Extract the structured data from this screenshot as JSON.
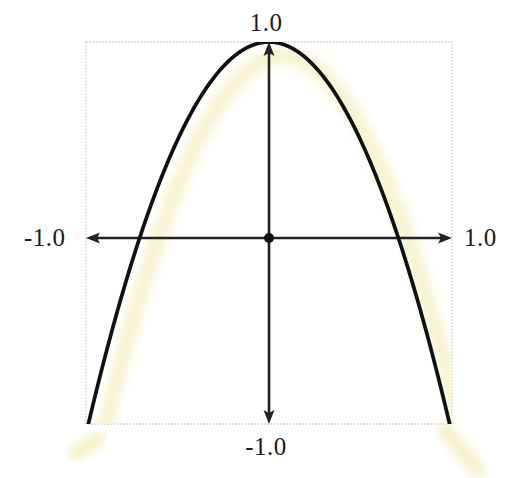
{
  "figure": {
    "name": "parabola-plot",
    "background_color": "#ffffff",
    "frame": {
      "color": "#cccccc",
      "style": "dotted",
      "x_min_px": 86,
      "y_min_px": 42,
      "x_max_px": 452,
      "y_max_px": 424
    },
    "origin_px": {
      "x": 269,
      "y": 238
    },
    "origin_marker": {
      "name": "origin-dot",
      "color": "#111111",
      "radius_px": 5
    }
  },
  "labels": {
    "top": "1.0",
    "bottom": "-1.0",
    "left": "-1.0",
    "right": "1.0"
  },
  "colors": {
    "curve": "#111111",
    "glow": "#f7f2cd",
    "axis": "#222222",
    "frame": "#cccccc",
    "text": "#1a1a1a",
    "background": "#ffffff"
  },
  "chart_data": {
    "type": "line",
    "title": "",
    "subtitle": "",
    "xlabel": "",
    "ylabel": "",
    "xlim": [
      -1.0,
      1.0
    ],
    "ylim": [
      -1.0,
      1.0
    ],
    "grid": false,
    "legend": null,
    "axes": {
      "x_axis": {
        "name": "horizontal-axis",
        "arrows": [
          "left",
          "right"
        ],
        "tick_labels": [
          "-1.0",
          "1.0"
        ],
        "tick_values": [
          -1.0,
          1.0
        ]
      },
      "y_axis": {
        "name": "vertical-axis",
        "arrows": [
          "up",
          "down"
        ],
        "tick_labels": [
          "1.0",
          "-1.0"
        ],
        "tick_values": [
          1.0,
          -1.0
        ]
      }
    },
    "annotations": [
      {
        "name": "origin-point",
        "x": 0.0,
        "y": 0.0,
        "label": ""
      },
      {
        "name": "vertex-point",
        "x": 0.0,
        "y": 1.0,
        "label": ""
      }
    ],
    "series": [
      {
        "name": "y = 1 - 2x^2",
        "expression": "1 - 2*x^2",
        "color": "#111111",
        "linewidth_px": 6,
        "x": [
          -1.0,
          -0.9,
          -0.8,
          -0.7071,
          -0.7,
          -0.6,
          -0.5,
          -0.4,
          -0.3,
          -0.2,
          -0.1,
          0.0,
          0.1,
          0.2,
          0.3,
          0.4,
          0.5,
          0.6,
          0.7,
          0.7071,
          0.8,
          0.9,
          1.0
        ],
        "values": [
          -1.0,
          -0.62,
          -0.28,
          0.0,
          0.02,
          0.28,
          0.5,
          0.68,
          0.82,
          0.92,
          0.98,
          1.0,
          0.98,
          0.92,
          0.82,
          0.68,
          0.5,
          0.28,
          0.02,
          0.0,
          -0.28,
          -0.62,
          -1.0
        ],
        "roots": [
          -0.7071,
          0.7071
        ],
        "vertex": {
          "x": 0.0,
          "y": 1.0
        }
      },
      {
        "name": "glow-shadow",
        "expression": "1 - 2*x^2 (offset)",
        "color": "#f7f2cd",
        "linewidth_px": 16,
        "offset_px": {
          "x": 14,
          "y": 14
        }
      }
    ]
  }
}
